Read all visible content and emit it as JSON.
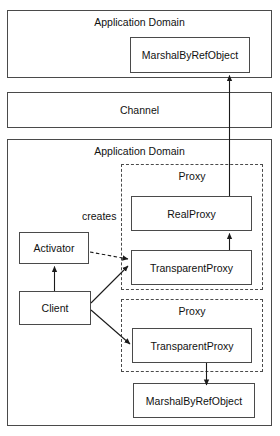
{
  "diagram": {
    "type": "architecture-block-diagram",
    "width": 280,
    "height": 436,
    "colors": {
      "background": "#ffffff",
      "stroke": "#4a4a4a",
      "arrow": "#1a1a1a",
      "text": "#111111"
    },
    "containers": {
      "top_app_domain": {
        "label": "Application Domain",
        "x": 7,
        "y": 10,
        "w": 265,
        "h": 68,
        "border": "solid"
      },
      "channel": {
        "label": "Channel",
        "x": 7,
        "y": 92,
        "w": 265,
        "h": 36,
        "border": "solid"
      },
      "bottom_app_domain": {
        "label": "Application Domain",
        "x": 7,
        "y": 139,
        "w": 265,
        "h": 287,
        "border": "solid"
      },
      "proxy_upper": {
        "label": "Proxy",
        "x": 121,
        "y": 164,
        "w": 142,
        "h": 126,
        "border": "dashed"
      },
      "proxy_lower": {
        "label": "Proxy",
        "x": 121,
        "y": 299,
        "w": 142,
        "h": 73,
        "border": "dashed"
      }
    },
    "nodes": {
      "marshal_top": {
        "label": "MarshalByRefObject",
        "x": 130,
        "y": 37,
        "w": 120,
        "h": 36
      },
      "real_proxy": {
        "label": "RealProxy",
        "x": 131,
        "y": 196,
        "w": 121,
        "h": 35
      },
      "transparent_proxy_upper": {
        "label": "TransparentProxy",
        "x": 131,
        "y": 250,
        "w": 121,
        "h": 35
      },
      "transparent_proxy_lower": {
        "label": "TransparentProxy",
        "x": 132,
        "y": 328,
        "w": 120,
        "h": 35
      },
      "marshal_bottom": {
        "label": "MarshalByRefObject",
        "x": 133,
        "y": 383,
        "w": 122,
        "h": 35
      },
      "activator": {
        "label": "Activator",
        "x": 19,
        "y": 232,
        "w": 70,
        "h": 32
      },
      "client": {
        "label": "Client",
        "x": 19,
        "y": 291,
        "w": 72,
        "h": 34
      }
    },
    "annotations": {
      "creates": {
        "label": "creates",
        "x": 82,
        "y": 210
      }
    },
    "connections": [
      {
        "name": "realproxy-to-marshal-top",
        "from": "real_proxy",
        "to": "marshal_top",
        "style": "solid",
        "arrowhead": "end"
      },
      {
        "name": "transparentproxy-to-realproxy",
        "from": "transparent_proxy_upper",
        "to": "real_proxy",
        "style": "solid",
        "arrowhead": "end"
      },
      {
        "name": "client-to-activator",
        "from": "client",
        "to": "activator",
        "style": "solid",
        "arrowhead": "end"
      },
      {
        "name": "activator-creates-transparentproxy",
        "from": "activator",
        "to": "transparent_proxy_upper",
        "style": "dashed",
        "arrowhead": "end",
        "label": "creates"
      },
      {
        "name": "client-to-transparentproxy-upper",
        "from": "client",
        "to": "transparent_proxy_upper",
        "style": "solid",
        "arrowhead": "end"
      },
      {
        "name": "client-to-transparentproxy-lower",
        "from": "client",
        "to": "transparent_proxy_lower",
        "style": "solid",
        "arrowhead": "end"
      },
      {
        "name": "transparentproxy-lower-to-marshal-bottom",
        "from": "transparent_proxy_lower",
        "to": "marshal_bottom",
        "style": "solid",
        "arrowhead": "end"
      }
    ]
  }
}
